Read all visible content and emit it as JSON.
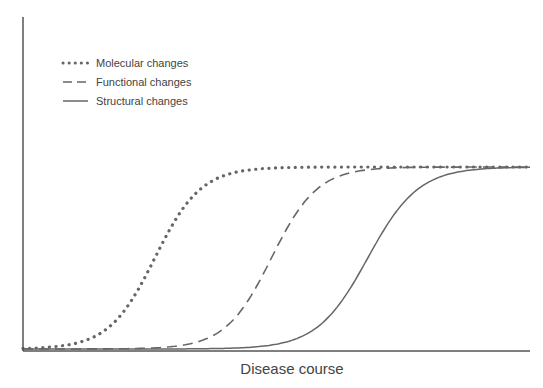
{
  "chart_data": {
    "type": "line",
    "title": "",
    "xlabel": "Disease course",
    "ylabel": "",
    "x_range": [
      0,
      100
    ],
    "y_range": [
      0,
      1
    ],
    "grid": false,
    "legend_position": "upper-left",
    "line_color": "#666666",
    "series": [
      {
        "name": "Molecular changes",
        "style": "dotted",
        "midpoint": 26,
        "steepness": 0.22,
        "plateau": 1.0
      },
      {
        "name": "Functional changes",
        "style": "dashed",
        "midpoint": 49,
        "steepness": 0.22,
        "plateau": 1.0
      },
      {
        "name": "Structural changes",
        "style": "solid",
        "midpoint": 68,
        "steepness": 0.2,
        "plateau": 1.0
      }
    ]
  },
  "legend": {
    "items": [
      {
        "label": "Molecular changes"
      },
      {
        "label": "Functional changes"
      },
      {
        "label": "Structural changes"
      }
    ]
  },
  "axes": {
    "xlabel": "Disease course"
  }
}
